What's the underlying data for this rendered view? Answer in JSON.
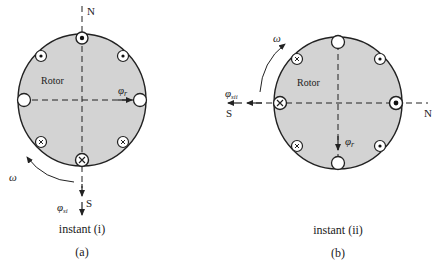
{
  "figure_a": {
    "rotor_label": "Rotor",
    "north_label": "N",
    "south_label": "S",
    "rotor_flux_symbol": "φ",
    "rotor_flux_sub": "r",
    "stator_flux_symbol": "φ",
    "stator_flux_sub": "si",
    "omega_label": "ω",
    "instant_label": "instant (i)",
    "caption": "(a)",
    "conductors": [
      {
        "position": "top",
        "type": "dot"
      },
      {
        "position": "upper-left",
        "type": "dot"
      },
      {
        "position": "upper-right",
        "type": "dot"
      },
      {
        "position": "left",
        "type": "empty"
      },
      {
        "position": "right",
        "type": "empty"
      },
      {
        "position": "lower-left",
        "type": "cross"
      },
      {
        "position": "lower-right",
        "type": "cross"
      },
      {
        "position": "bottom",
        "type": "cross"
      }
    ]
  },
  "figure_b": {
    "rotor_label": "Rotor",
    "north_label": "N",
    "south_label": "S",
    "rotor_flux_symbol": "φ",
    "rotor_flux_sub": "r",
    "stator_flux_symbol": "φ",
    "stator_flux_sub": "sii",
    "omega_label": "ω",
    "instant_label": "instant (ii)",
    "caption": "(b)",
    "conductors": [
      {
        "position": "top",
        "type": "empty"
      },
      {
        "position": "upper-left",
        "type": "cross"
      },
      {
        "position": "upper-right",
        "type": "dot"
      },
      {
        "position": "left",
        "type": "cross"
      },
      {
        "position": "right",
        "type": "dot"
      },
      {
        "position": "lower-left",
        "type": "cross"
      },
      {
        "position": "lower-right",
        "type": "dot"
      },
      {
        "position": "bottom",
        "type": "empty"
      }
    ]
  },
  "colors": {
    "rotor_fill": "#d3d3d3",
    "stroke": "#222222",
    "background": "#ffffff"
  }
}
